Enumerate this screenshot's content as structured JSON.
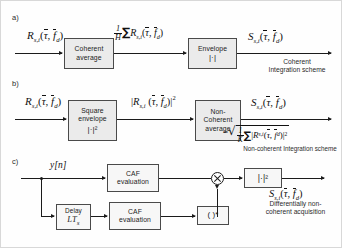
{
  "figure": {
    "panels": [
      {
        "id": "a",
        "label": "a)",
        "scheme_caption_line1": "Coherent",
        "scheme_caption_line2": "Integration scheme",
        "input_label": "R",
        "input_sub": "s,i",
        "input_args": "(τ̄, f̄",
        "blocks": [
          {
            "name": "coherent-average",
            "line1": "Coherent",
            "line2": "average"
          },
          {
            "name": "envelope",
            "line1": "Envelope",
            "line2": "|·|"
          }
        ],
        "mid_label": {
          "frac_num": "1",
          "frac_den": "H",
          "sigma": "∑",
          "symbol": "R",
          "sub": "s,i"
        },
        "output_label": {
          "symbol": "S",
          "sub": "s,i"
        }
      },
      {
        "id": "b",
        "label": "b)",
        "scheme_caption_line1": "Non-coherent Integration scheme",
        "input_label": "R",
        "input_sub": "s,i",
        "blocks": [
          {
            "name": "square-envelope",
            "line1": "Square",
            "line2": "envelope",
            "line3": "|·|²"
          },
          {
            "name": "non-coherent-average",
            "line1": "Non-",
            "line2": "Coherent",
            "line3": "average"
          }
        ],
        "mid_label": {
          "symbol": "R",
          "sub": "s,i",
          "exponent": "2"
        },
        "output_label": {
          "symbol": "S",
          "sub": "s,i"
        },
        "output_formula": {
          "equals": "=",
          "frac_num": "1",
          "frac_den": "K",
          "sigma": "∑",
          "symbol": "R",
          "sub": "s,i",
          "exponent": "2"
        }
      },
      {
        "id": "c",
        "label": "c)",
        "scheme_caption_line1": "Differentially non-",
        "scheme_caption_line2": "coherent acquisition",
        "input_label": "y[n]",
        "blocks": [
          {
            "name": "caf-evaluation-top",
            "line1": "CAF",
            "line2": "evaluation"
          },
          {
            "name": "delay",
            "line1": "Delay",
            "math": "LT",
            "math_sub": "s"
          },
          {
            "name": "caf-evaluation-bottom",
            "line1": "CAF",
            "line2": "evaluation"
          },
          {
            "name": "conjugate",
            "line1": "( )*"
          },
          {
            "name": "square-modulus",
            "line1": "|·|²"
          }
        ],
        "multiplier_symbol": "⊗",
        "output_label": {
          "symbol": "S",
          "sub": "s,i"
        }
      }
    ],
    "symbols": {
      "tau_bar": "τ",
      "f_d_bar": "f",
      "d_sub": "d",
      "open_paren": "(",
      "close_paren": ")",
      "comma": ",",
      "abs_bar": "|"
    }
  }
}
